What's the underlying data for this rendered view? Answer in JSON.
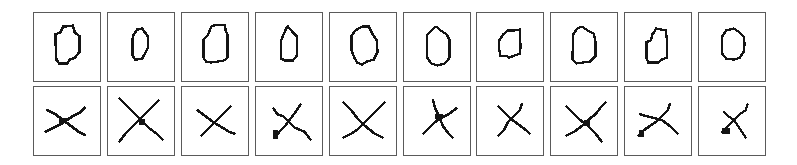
{
  "figure": {
    "rows": 2,
    "columns": 10,
    "grid_origin": {
      "x": 33,
      "y": 12
    },
    "column_pitch": 73.9,
    "cell_width": 68,
    "row_tops": [
      12,
      86
    ],
    "cell_height": 70,
    "colors": {
      "border": "#5a5a5a",
      "ink": "#141414",
      "background": "#ffffff"
    }
  },
  "row_labels": [
    "Handwritten zero samples",
    "Handwritten cross samples"
  ],
  "samples": [
    [
      {
        "label": "0",
        "stroke": 2.6,
        "paths": [
          "M27 20 L30 14 L40 13 L42 20 L47 24 L47 40 L42 46 L37 48 L34 52 L26 52 L23 48 L22 22 Z"
        ]
      },
      {
        "label": "0",
        "stroke": 2.6,
        "paths": [
          "M26 23 L30 17 L35 16 L38 20 L41 24 L41 36 L38 42 L35 47 L28 48 L25 43 L25 28 Z"
        ]
      },
      {
        "label": "0",
        "stroke": 2.4,
        "paths": [
          "M30 14 L35 12 L44 12 L45 18 L47 22 L47 46 L43 49 L30 51 L25 50 L22 46 L22 28 L27 22 L29 17 Z"
        ]
      },
      {
        "label": "0",
        "stroke": 2.4,
        "paths": [
          "M28 23 L31 16 L33 14 L38 20 L42 24 L42 44 L38 49 L30 49 L26 47 L26 28 Z"
        ]
      },
      {
        "label": "0",
        "stroke": 2.4,
        "paths": [
          "M26 18 L33 14 L40 14 L44 22 L48 28 L49 40 L45 48 L38 50 L33 53 L28 51 L25 46 L22 38 L22 24 Z"
        ]
      },
      {
        "label": "0",
        "stroke": 2.4,
        "paths": [
          "M24 22 L29 17 L33 14 L38 18 L44 22 L47 28 L47 46 L42 52 L34 54 L28 52 L24 46 Z"
        ]
      },
      {
        "label": "0",
        "stroke": 2.4,
        "paths": [
          "M27 22 L32 18 L38 18 L44 17 L44 26 L45 34 L44 42 L38 44 L33 46 L30 44 L24 44 L23 38 L23 28 Z"
        ]
      },
      {
        "label": "0",
        "stroke": 2.4,
        "paths": [
          "M23 22 L27 16 L32 14 L38 18 L44 21 L46 30 L46 44 L40 50 L26 52 L22 48 Z"
        ]
      },
      {
        "label": "0",
        "stroke": 2.4,
        "paths": [
          "M30 20 L32 16 L42 18 L43 26 L43 46 L38 48 L34 51 L24 51 L22 46 L22 30 L27 28 L28 22 Z"
        ]
      },
      {
        "label": "0",
        "stroke": 2.4,
        "paths": [
          "M24 24 L28 18 L36 16 L42 20 L46 24 L47 32 L46 40 L42 46 L36 48 L28 47 L24 42 Z"
        ]
      }
    ],
    [
      {
        "label": "x",
        "stroke": 2.8,
        "paths": [
          "M14 24 L22 28 L30 34 L38 40 L46 46 L52 49",
          "M12 46 L20 42 L28 38 L34 34 L40 30 L48 26 L52 22"
        ],
        "blobs": [
          [
            26,
            32,
            8,
            5
          ]
        ]
      },
      {
        "label": "x",
        "stroke": 2.6,
        "paths": [
          "M12 12 L22 22 L32 32 L42 42 L50 48 L56 54",
          "M12 56 L18 48 L24 42 L28 38 L34 32 L42 24 L52 14"
        ],
        "blobs": [
          [
            32,
            33,
            6,
            6
          ]
        ]
      },
      {
        "label": "x",
        "stroke": 2.6,
        "paths": [
          "M16 24 L24 30 L32 36 L42 42 L48 46 L54 48",
          "M20 50 L26 44 L32 38 L38 32 L44 26 L50 20"
        ]
      },
      {
        "label": "x",
        "stroke": 2.6,
        "paths": [
          "M18 22 L22 28 L28 30 L34 36 L40 42 L50 46 L56 54",
          "M20 52 L24 46 L30 40 L36 32 L42 24 L46 18"
        ],
        "blobs": [
          [
            18,
            44,
            5,
            10
          ]
        ]
      },
      {
        "label": "x",
        "stroke": 2.6,
        "paths": [
          "M14 16 L22 24 L28 32 L36 40 L46 48 L54 52",
          "M14 52 L22 48 L28 44 L34 38 L42 30 L50 22 L56 16"
        ]
      },
      {
        "label": "x",
        "stroke": 2.6,
        "paths": [
          "M30 14 L32 22 L36 30 L40 40 L46 48 L50 52",
          "M20 48 L26 42 L32 36 L38 32 L46 28 L54 22"
        ],
        "blobs": [
          [
            32,
            28,
            8,
            5
          ]
        ]
      },
      {
        "label": "x",
        "stroke": 2.6,
        "paths": [
          "M22 20 L28 26 L34 32 L42 38 L50 44 L54 48",
          "M22 50 L28 44 L32 36 L38 30 L44 24 L46 18"
        ]
      },
      {
        "label": "x",
        "stroke": 2.6,
        "paths": [
          "M16 20 L24 28 L30 34 L38 40 L46 48 L52 56",
          "M16 50 L24 46 L32 40 L38 34 L46 28 L52 20 L56 16"
        ],
        "blobs": [
          [
            34,
            34,
            6,
            6
          ]
        ]
      },
      {
        "label": "x",
        "stroke": 2.6,
        "paths": [
          "M16 28 L22 30 L30 32 L38 34 L46 40 L54 48",
          "M14 50 L20 44 L26 40 L32 36 L38 30 L44 24 L46 18"
        ],
        "blobs": [
          [
            14,
            44,
            6,
            7
          ]
        ]
      },
      {
        "label": "x",
        "stroke": 2.4,
        "paths": [
          "M26 26 L30 30 L36 34 L40 40 L44 46 L48 52",
          "M24 46 L30 40 L36 34 L42 28 L48 24 L50 18"
        ],
        "blobs": [
          [
            24,
            42,
            8,
            6
          ]
        ]
      }
    ]
  ]
}
